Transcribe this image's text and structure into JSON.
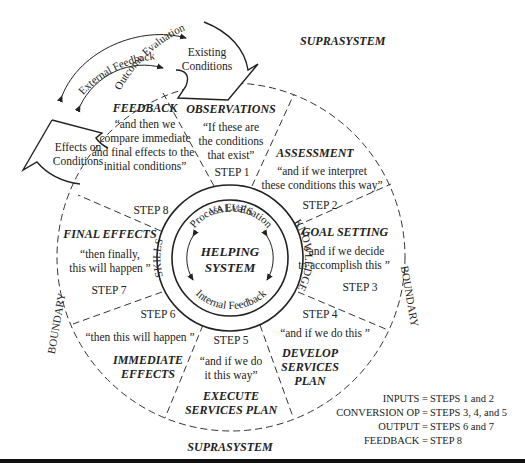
{
  "labels": {
    "suprasystem_top": "SUPRASYSTEM",
    "suprasystem_bottom": "SUPRASYSTEM",
    "boundary_left": "BOUNDARY",
    "boundary_right": "BOUNDARY",
    "outcome_evaluation": "Outcome Evaluation",
    "external_feedback": "External Feedback",
    "existing_conditions_1": "Existing",
    "existing_conditions_2": "Conditions",
    "effects_on_conditions_1": "Effects on",
    "effects_on_conditions_2": "Conditions"
  },
  "core": {
    "title_1": "HELPING",
    "title_2": "SYSTEM",
    "process_evaluation": "Process Evaluation",
    "internal_feedback": "Internal Feedback",
    "values": "VALUES",
    "knowledge": "KNOWLEDGE",
    "skills": "SKILLS"
  },
  "steps": [
    {
      "step": "STEP 1",
      "name": "OBSERVATIONS",
      "quote": [
        "“If these are",
        "the conditions",
        "that exist”"
      ]
    },
    {
      "step": "STEP 2",
      "name": "ASSESSMENT",
      "quote": [
        "“and if we interpret",
        "these conditions this way”"
      ]
    },
    {
      "step": "STEP 3",
      "name": "GOAL SETTING",
      "quote": [
        "“and if we decide",
        "to accomplish this ”"
      ]
    },
    {
      "step": "STEP 4",
      "name": [
        "DEVELOP",
        "SERVICES",
        "PLAN"
      ],
      "quote": [
        "“and if we do this ”"
      ]
    },
    {
      "step": "STEP 5",
      "name": [
        "EXECUTE",
        "SERVICES PLAN"
      ],
      "quote": [
        "“and if we do",
        "it this way”"
      ]
    },
    {
      "step": "STEP 6",
      "name": [
        "IMMEDIATE",
        "EFFECTS"
      ],
      "quote": [
        "“then this will happen ”"
      ]
    },
    {
      "step": "STEP 7",
      "name": "FINAL EFFECTS",
      "quote": [
        "“then finally,",
        "this will happen ”"
      ]
    },
    {
      "step": "STEP 8",
      "name": "FEEDBACK",
      "quote": [
        "“and then we",
        "compare immediate",
        "and final effects to the",
        "initial conditions”"
      ]
    }
  ],
  "legend": [
    {
      "key": "INPUTS =",
      "value": "STEPS 1 and 2"
    },
    {
      "key": "CONVERSION OP =",
      "value": "STEPS 3, 4, and 5"
    },
    {
      "key": "OUTPUT =",
      "value": "STEPS 6 and 7"
    },
    {
      "key": "FEEDBACK =",
      "value": "STEP 8"
    }
  ]
}
